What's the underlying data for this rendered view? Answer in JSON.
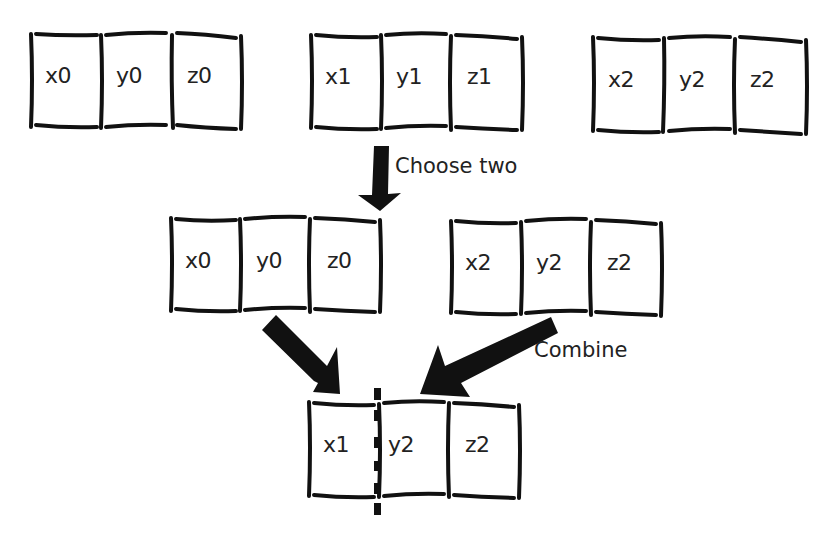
{
  "diagram": {
    "title": "",
    "rows": {
      "population": [
        {
          "id": "individual-0",
          "cells": [
            "x0",
            "y0",
            "z0"
          ]
        },
        {
          "id": "individual-1",
          "cells": [
            "x1",
            "y1",
            "z1"
          ]
        },
        {
          "id": "individual-2",
          "cells": [
            "x2",
            "y2",
            "z2"
          ]
        }
      ],
      "selected": [
        {
          "id": "parent-a",
          "cells": [
            "x0",
            "y0",
            "z0"
          ]
        },
        {
          "id": "parent-b",
          "cells": [
            "x2",
            "y2",
            "z2"
          ]
        }
      ],
      "offspring": {
        "id": "child",
        "cells": [
          "x1",
          "y2",
          "z2"
        ]
      }
    },
    "labels": {
      "choose": "Choose two",
      "combine": "Combine"
    },
    "colors": {
      "stroke": "#111111",
      "background": "#ffffff"
    }
  }
}
